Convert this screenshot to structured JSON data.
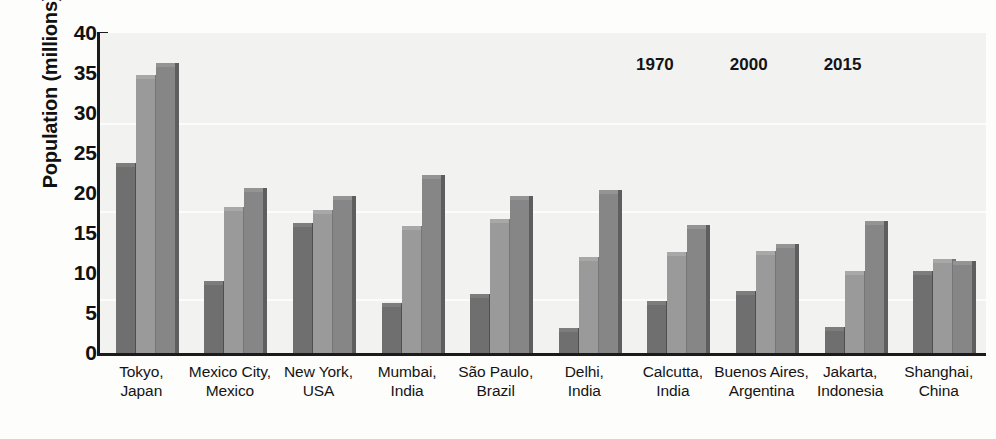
{
  "chart_data": {
    "type": "bar",
    "title": "",
    "xlabel": "",
    "ylabel": "Population (millions)",
    "ylim": [
      0,
      40
    ],
    "ytick_labels": [
      "0",
      "5",
      "10",
      "15",
      "20",
      "25",
      "30",
      "35",
      "40"
    ],
    "ytick_values": [
      0,
      5,
      10,
      15,
      20,
      25,
      30,
      35,
      40
    ],
    "grid": false,
    "legend_position": "top-right",
    "categories": [
      "Tokyo, Japan",
      "Mexico City, Mexico",
      "New York, USA",
      "Mumbai, India",
      "São Paulo, Brazil",
      "Delhi, India",
      "Calcutta, India",
      "Buenos Aires, Argentina",
      "Jakarta, Indonesia",
      "Shanghai, China"
    ],
    "category_lines": [
      {
        "line1": "Tokyo,",
        "line2": "Japan"
      },
      {
        "line1": "Mexico City,",
        "line2": "Mexico"
      },
      {
        "line1": "New York,",
        "line2": "USA"
      },
      {
        "line1": "Mumbai,",
        "line2": "India"
      },
      {
        "line1": "São Paulo,",
        "line2": "Brazil"
      },
      {
        "line1": "Delhi,",
        "line2": "India"
      },
      {
        "line1": "Calcutta,",
        "line2": "India"
      },
      {
        "line1": "Buenos Aires,",
        "line2": "Argentina"
      },
      {
        "line1": "Jakarta,",
        "line2": "Indonesia"
      },
      {
        "line1": "Shanghai,",
        "line2": "China"
      }
    ],
    "series": [
      {
        "name": "1970",
        "color": "#6f6f6f",
        "values": [
          23.2,
          8.5,
          15.8,
          5.8,
          6.9,
          2.6,
          6.0,
          7.3,
          2.8,
          9.8
        ]
      },
      {
        "name": "2000",
        "color": "#9a9a9a",
        "values": [
          34.2,
          17.7,
          17.4,
          15.4,
          16.3,
          11.5,
          12.1,
          12.2,
          9.7,
          11.2
        ]
      },
      {
        "name": "2015",
        "color": "#868686",
        "values": [
          35.8,
          20.1,
          19.1,
          21.8,
          19.1,
          19.9,
          15.5,
          13.1,
          16.0,
          11.0
        ]
      }
    ]
  },
  "legend": {
    "items": [
      {
        "label": "1970"
      },
      {
        "label": "2000"
      },
      {
        "label": "2015"
      }
    ]
  },
  "axes": {
    "y_title": "Population (millions)"
  }
}
